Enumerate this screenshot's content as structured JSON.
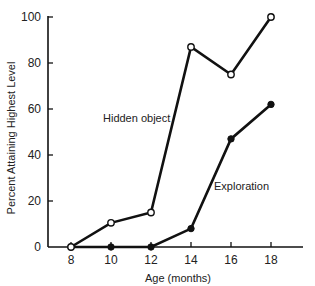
{
  "chart_data": {
    "type": "line",
    "title": "",
    "xlabel": "Age (months)",
    "ylabel": "Percent Attaining Highest Level",
    "x": [
      8,
      10,
      12,
      14,
      16,
      18
    ],
    "xticks": [
      "8",
      "10",
      "12",
      "14",
      "16",
      "18"
    ],
    "yticks": [
      "0",
      "20",
      "40",
      "60",
      "80",
      "100"
    ],
    "xlim": [
      6.8,
      21
    ],
    "ylim": [
      0,
      100
    ],
    "grid": false,
    "legend": "inline labels",
    "series": [
      {
        "name": "Hidden object",
        "marker": "open-circle",
        "values": [
          0,
          10.5,
          15,
          87,
          75,
          100
        ]
      },
      {
        "name": "Exploration",
        "marker": "filled-circle",
        "values": [
          0,
          0,
          0,
          8,
          47,
          62
        ]
      }
    ]
  },
  "colors": {
    "line": "#111111",
    "background": "#ffffff"
  }
}
